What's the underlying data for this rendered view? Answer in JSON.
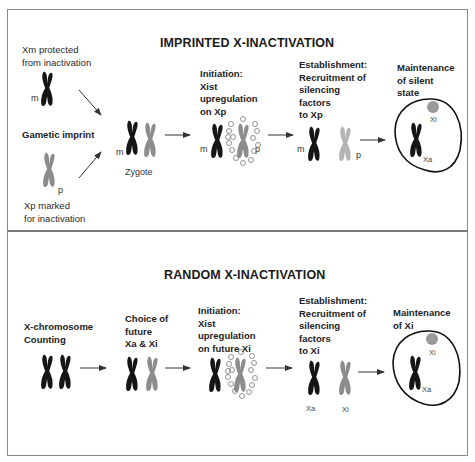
{
  "colors": {
    "active_chromosome": "#151515",
    "inactive_chromosome": "#8c8c8c",
    "silenced_chromosome": "#b4b4b4",
    "xi_body": "#9a9a9a",
    "border": "#8a8a8a"
  },
  "imprinted": {
    "title": "IMPRINTED X-INACTIVATION",
    "xm_label": "Xm protected\nfrom inactivation",
    "gametic_imprint": "Gametic imprint",
    "xp_label": "Xp marked\nfor inactivation",
    "zygote": "Zygote",
    "initiation": "Initiation:\nXist\nupregulation\non Xp",
    "establishment": "Establishment:\nRecruitment of\nsilencing\nfactors\nto Xp",
    "maintenance": "Maintenance\nof silent\nstate",
    "m": "m",
    "p": "p",
    "xi": "Xi",
    "xa": "Xa"
  },
  "random": {
    "title": "RANDOM X-INACTIVATION",
    "counting": "X-chromosome\nCounting",
    "choice": "Choice of\nfuture\nXa & Xi",
    "initiation": "Initiation:\nXist\nupregulation\non future Xi",
    "establishment": "Establishment:\nRecruitment of\nsilencing\nfactors\nto Xi",
    "maintenance": "Maintenance\nof Xi",
    "xa": "Xa",
    "xi": "Xi"
  }
}
